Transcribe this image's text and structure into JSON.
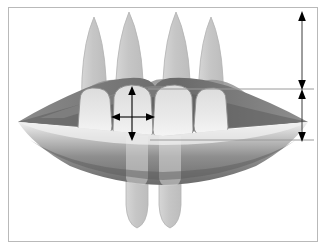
{
  "figure": {
    "kind": "anatomical-line-diagram",
    "canvas": {
      "width": 326,
      "height": 249
    },
    "background_color": "#ffffff",
    "frame": {
      "label": "image border",
      "color": "#b9b9b9",
      "x": 8,
      "y": 7,
      "width": 310,
      "height": 235,
      "stroke_width": 1
    }
  },
  "palette": {
    "background": "#ffffff",
    "frame_border": "#b9b9b9",
    "root_fill": "#c9c9c9",
    "root_stroke": "#b0b0b0",
    "crown_fill": "#e9e9e9",
    "crown_stroke": "#8d8d8d",
    "upper_lip_dark": "#6e6e6e",
    "upper_lip_light": "#bdbdbd",
    "lower_lip_light": "#e0e0e0",
    "lower_lip_dark": "#707070",
    "oral_cavity": "#ffffff",
    "gingiva": "#a8a8a8",
    "arrow_black": "#000000",
    "reference_line": "#9a9a9a"
  },
  "upper_teeth": {
    "label": "maxillary anterior teeth",
    "count": 4,
    "items": [
      {
        "name": "upper-lateral-incisor-left",
        "position": "patient right lateral incisor",
        "root": {
          "apex_x": 94,
          "apex_y": 17,
          "cervical_y": 105,
          "half_width": 12
        },
        "crown": {
          "x": 78,
          "y": 88,
          "width": 34,
          "height": 48,
          "corner_radius": 11
        }
      },
      {
        "name": "upper-central-incisor-left",
        "position": "patient right central incisor",
        "root": {
          "apex_x": 129,
          "apex_y": 12,
          "cervical_y": 108,
          "half_width": 13
        },
        "crown": {
          "x": 112,
          "y": 85,
          "width": 40,
          "height": 55,
          "corner_radius": 10
        }
      },
      {
        "name": "upper-central-incisor-right",
        "position": "patient left central incisor",
        "root": {
          "apex_x": 176,
          "apex_y": 12,
          "cervical_y": 108,
          "half_width": 13
        },
        "crown": {
          "x": 153,
          "y": 85,
          "width": 40,
          "height": 55,
          "corner_radius": 10
        }
      },
      {
        "name": "upper-lateral-incisor-right",
        "position": "patient left lateral incisor",
        "root": {
          "apex_x": 211,
          "apex_y": 17,
          "cervical_y": 105,
          "half_width": 12
        },
        "crown": {
          "x": 194,
          "y": 88,
          "width": 34,
          "height": 48,
          "corner_radius": 11
        }
      }
    ]
  },
  "lower_teeth": {
    "label": "mandibular anterior teeth (seen through lower lip)",
    "count": 2,
    "items": [
      {
        "name": "lower-incisor-left",
        "root": {
          "apex_x": 137,
          "apex_y": 228,
          "cervical_y": 140,
          "half_width": 11
        }
      },
      {
        "name": "lower-incisor-right",
        "root": {
          "apex_x": 170,
          "apex_y": 228,
          "cervical_y": 140,
          "half_width": 11
        }
      }
    ]
  },
  "lips": {
    "upper_lip": {
      "name": "upper-lip",
      "left_commissure_x": 18,
      "right_commissure_x": 308,
      "commissure_y": 122,
      "cupid_bow_y": 77,
      "description": "upper lip with vermilion, darker gray shading"
    },
    "lower_lip": {
      "name": "lower-lip",
      "left_commissure_x": 18,
      "right_commissure_x": 308,
      "commissure_y": 122,
      "lowest_y": 182,
      "description": "lower lip with light-to-dark vertical gradient"
    },
    "oral_opening": {
      "name": "oral-aperture",
      "left_x": 18,
      "right_x": 308,
      "y": 122,
      "description": "white interlabial gap between upper and lower lip"
    }
  },
  "measurements": {
    "label": "measurement annotations",
    "tooth_arrows": [
      {
        "name": "crown-height-arrow",
        "orientation": "vertical",
        "description": "vertical double-headed arrow across the crown height of the central incisor",
        "x": 132,
        "y_top": 88,
        "y_bottom": 139,
        "arrowheads": "both"
      },
      {
        "name": "crown-width-arrow",
        "orientation": "horizontal",
        "description": "horizontal double-headed arrow across the mesio-distal crown width of the central incisor",
        "y": 117,
        "x_left": 113,
        "x_right": 153,
        "arrowheads": "both"
      }
    ],
    "vertical_dimensions": [
      {
        "name": "upper-vertical-dimension-arrow",
        "orientation": "vertical",
        "description": "upper vertical dimension from the top reference line upward",
        "x": 302,
        "y_top": 13,
        "y_bottom": 88,
        "arrowheads": "both"
      },
      {
        "name": "lower-vertical-dimension-arrow",
        "orientation": "vertical",
        "description": "lower vertical dimension between the two horizontal reference lines",
        "x": 302,
        "y_top": 90,
        "y_bottom": 140,
        "arrowheads": "both"
      }
    ],
    "reference_lines": [
      {
        "name": "upper-reference-line",
        "orientation": "horizontal",
        "description": "horizontal reference line at the maxillary gingival / incisal display level",
        "y": 89,
        "x_start": 148,
        "x_end": 314
      },
      {
        "name": "lower-reference-line",
        "orientation": "horizontal",
        "description": "horizontal reference line at the lower lip / incisal edge level",
        "y": 140,
        "x_start": 150,
        "x_end": 314
      }
    ]
  }
}
